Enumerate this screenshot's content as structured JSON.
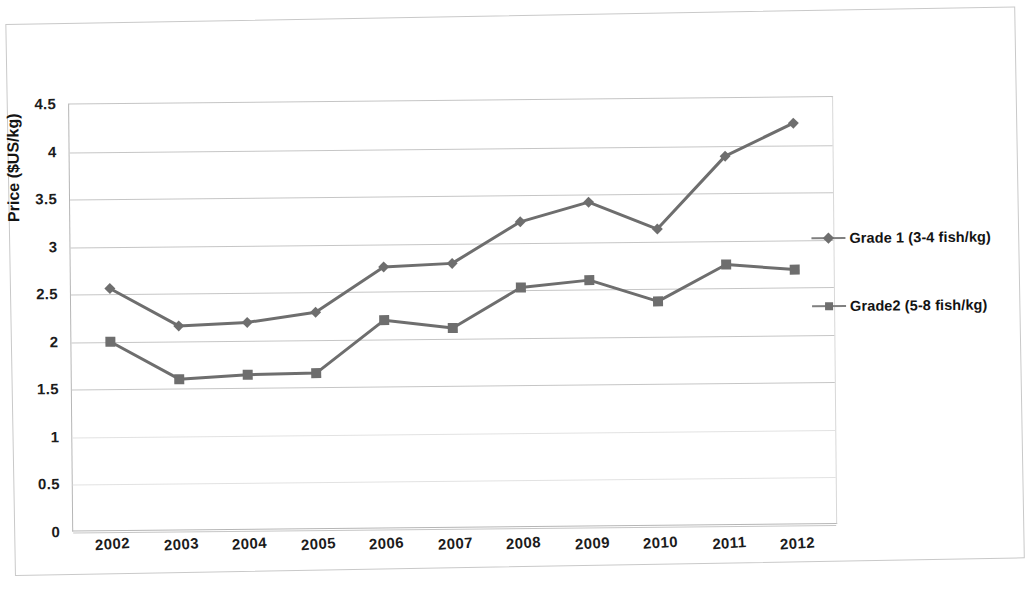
{
  "chart_data": {
    "type": "line",
    "title": "",
    "xlabel": "",
    "ylabel": "Price ($US/kg)",
    "categories": [
      "2002",
      "2003",
      "2004",
      "2005",
      "2006",
      "2007",
      "2008",
      "2009",
      "2010",
      "2011",
      "2012"
    ],
    "ylim": [
      0,
      4.5
    ],
    "ytick_labels": [
      "4.5",
      "4",
      "3.5",
      "3",
      "2.5",
      "2",
      "1.5",
      "1",
      "0.5",
      "0"
    ],
    "ytick_values": [
      4.5,
      4,
      3.5,
      3,
      2.5,
      2,
      1.5,
      1,
      0.5,
      0
    ],
    "grid": true,
    "legend_position": "right",
    "series": [
      {
        "name": "Grade 1 (3-4 fish/kg)",
        "marker": "diamond",
        "color": "#6e6e6e",
        "values": [
          2.55,
          2.15,
          2.18,
          2.28,
          2.75,
          2.78,
          3.21,
          3.41,
          3.12,
          3.88,
          4.22
        ]
      },
      {
        "name": "Grade2 (5-8 fish/kg)",
        "marker": "square",
        "color": "#6e6e6e",
        "values": [
          1.99,
          1.59,
          1.63,
          1.64,
          2.19,
          2.1,
          2.52,
          2.59,
          2.36,
          2.74,
          2.68
        ]
      }
    ]
  },
  "legend": {
    "entries": [
      {
        "label": "Grade 1 (3-4 fish/kg)",
        "marker": "diamond"
      },
      {
        "label": "Grade2 (5-8 fish/kg)",
        "marker": "square"
      }
    ]
  },
  "colors": {
    "series": "#6e6e6e",
    "gridline": "#c6c6c6",
    "axis": "#b6b6b6",
    "text": "#141414"
  },
  "bottom_caption": ""
}
